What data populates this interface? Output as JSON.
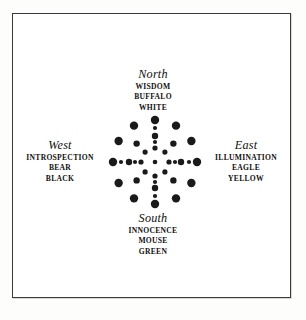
{
  "figure": {
    "type": "medicine-wheel-diagram",
    "background_color": "#ffffff",
    "frame_color": "#3a3a3a",
    "dot_color": "#1a1a1a"
  },
  "directions": [
    {
      "id": "north",
      "title": "North",
      "words": [
        "WISDOM",
        "BUFFALO",
        "WHITE"
      ],
      "position": "top"
    },
    {
      "id": "west",
      "title": "West",
      "words": [
        "INTROSPECTION",
        "BEAR",
        "BLACK"
      ],
      "position": "left"
    },
    {
      "id": "east",
      "title": "East",
      "words": [
        "ILLUMINATION",
        "EAGLE",
        "YELLOW"
      ],
      "position": "right"
    },
    {
      "id": "south",
      "title": "South",
      "words": [
        "INNOCENCE",
        "MOUSE",
        "GREEN"
      ],
      "position": "bottom"
    }
  ],
  "wheel": {
    "description": "concentric radial dot pattern forming a cross and ring",
    "rings": [
      {
        "name": "outer-ring",
        "radius": 42,
        "dot_radius": 4.2,
        "count": 12,
        "angles_deg": [
          0,
          30,
          60,
          90,
          120,
          150,
          180,
          210,
          240,
          270,
          300,
          330
        ]
      },
      {
        "name": "mid-cross",
        "radius": 26,
        "dot_radius": 3.2,
        "count": 8,
        "angles_deg": [
          0,
          45,
          90,
          135,
          180,
          225,
          270,
          315
        ]
      },
      {
        "name": "inner-cross",
        "radius": 14,
        "dot_radius": 2.6,
        "count": 8,
        "angles_deg": [
          0,
          45,
          90,
          135,
          180,
          225,
          270,
          315
        ]
      },
      {
        "name": "axis-fill",
        "radius": 34,
        "dot_radius": 2.1,
        "count": 4,
        "angles_deg": [
          0,
          90,
          180,
          270
        ]
      },
      {
        "name": "axis-fill-inner",
        "radius": 20,
        "dot_radius": 2.1,
        "count": 4,
        "angles_deg": [
          0,
          90,
          180,
          270
        ]
      },
      {
        "name": "center",
        "radius": 0,
        "dot_radius": 2.3,
        "count": 1,
        "angles_deg": [
          0
        ]
      }
    ]
  }
}
